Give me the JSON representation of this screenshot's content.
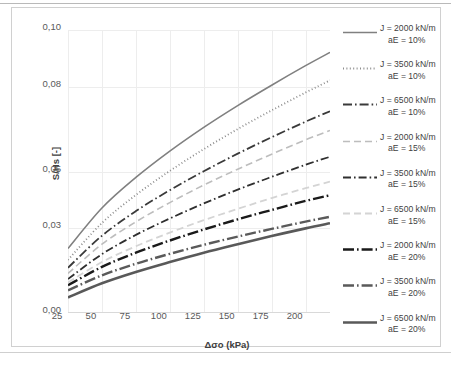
{
  "chart_data": {
    "type": "line",
    "title": "",
    "xlabel": "Δσo (kPa)",
    "ylabel": "S/Hs [-]",
    "xlim": [
      25,
      218
    ],
    "ylim": [
      0.0,
      0.1
    ],
    "xticks": [
      "25",
      "50",
      "75",
      "100",
      "125",
      "150",
      "175",
      "200"
    ],
    "xtick_values": [
      25,
      50,
      75,
      100,
      125,
      150,
      175,
      200
    ],
    "yticks": [
      "0,00",
      "0,03",
      "0,05",
      "0,08",
      "0,10"
    ],
    "ytick_values": [
      0.0,
      0.03,
      0.05,
      0.08,
      0.1
    ],
    "grid": true,
    "legend_position": "right",
    "x": [
      25,
      50,
      75,
      100,
      125,
      150,
      175,
      200,
      218
    ],
    "series": [
      {
        "name": "J = 2000 kN/m aE = 10%",
        "label_line1": "J = 2000 kN/m",
        "label_line2": "aE = 10%",
        "J": 2000,
        "aE": "10%",
        "style": "solid",
        "color": "#808080",
        "width": 1.6,
        "values": [
          0.0228,
          0.0371,
          0.0479,
          0.0572,
          0.0656,
          0.0733,
          0.0805,
          0.0874,
          0.0921
        ]
      },
      {
        "name": "J = 3500 kN/m aE = 10%",
        "label_line1": "J = 3500 kN/m",
        "label_line2": "aE = 10%",
        "J": 3500,
        "aE": "10%",
        "style": "dotted",
        "color": "#8c8c8c",
        "width": 1.8,
        "values": [
          0.0188,
          0.0318,
          0.0417,
          0.0502,
          0.0579,
          0.065,
          0.0716,
          0.0779,
          0.0822
        ]
      },
      {
        "name": "J = 6500 kN/m aE = 10%",
        "label_line1": "J = 6500 kN/m",
        "label_line2": "aE = 10%",
        "J": 6500,
        "aE": "10%",
        "style": "dashdot-dark",
        "color": "#3a3a3a",
        "width": 1.8,
        "values": [
          0.016,
          0.0273,
          0.036,
          0.0434,
          0.0501,
          0.0563,
          0.0621,
          0.0676,
          0.0713
        ]
      },
      {
        "name": "J = 2000 kN/m aE = 15%",
        "label_line1": "J = 2000 kN/m",
        "label_line2": "aE = 15%",
        "J": 2000,
        "aE": "15%",
        "style": "dashed-light",
        "color": "#bdbdbd",
        "width": 1.6,
        "values": [
          0.014,
          0.0243,
          0.0322,
          0.039,
          0.0452,
          0.0508,
          0.0561,
          0.0612,
          0.0645
        ]
      },
      {
        "name": "J = 3500 kN/m aE = 15%",
        "label_line1": "J = 3500 kN/m",
        "label_line2": "aE = 15%",
        "J": 3500,
        "aE": "15%",
        "style": "dashdot-mid",
        "color": "#2f2f2f",
        "width": 1.8,
        "values": [
          0.012,
          0.0208,
          0.0276,
          0.0334,
          0.0387,
          0.0436,
          0.0481,
          0.0524,
          0.0552
        ]
      },
      {
        "name": "J = 6500 kN/m aE = 15%",
        "label_line1": "J = 6500 kN/m",
        "label_line2": "aE = 15%",
        "J": 6500,
        "aE": "15%",
        "style": "dashed-verylight",
        "color": "#d4d4d4",
        "width": 1.8,
        "values": [
          0.0108,
          0.018,
          0.0236,
          0.0284,
          0.0328,
          0.0368,
          0.0406,
          0.0441,
          0.0464
        ]
      },
      {
        "name": "J = 2000 kN/m aE = 20%",
        "label_line1": "J = 2000 kN/m",
        "label_line2": "aE = 20%",
        "J": 2000,
        "aE": "20%",
        "style": "longdash-dot-bold",
        "color": "#1a1a1a",
        "width": 2.4,
        "values": [
          0.0098,
          0.0163,
          0.0213,
          0.0256,
          0.0295,
          0.0331,
          0.0364,
          0.0396,
          0.0416
        ]
      },
      {
        "name": "J = 3500 kN/m aE = 20%",
        "label_line1": "J = 3500 kN/m",
        "label_line2": "aE = 20%",
        "J": 3500,
        "aE": "20%",
        "style": "longdash-dot-grey",
        "color": "#5a5a5a",
        "width": 2.4,
        "values": [
          0.008,
          0.0133,
          0.0174,
          0.0209,
          0.0241,
          0.027,
          0.0297,
          0.0323,
          0.034
        ]
      },
      {
        "name": "J = 6500 kN/m aE = 20%",
        "label_line1": "J = 6500 kN/m",
        "label_line2": "aE = 20%",
        "J": 6500,
        "aE": "20%",
        "style": "solid-bold",
        "color": "#595959",
        "width": 2.6,
        "values": [
          0.0055,
          0.0105,
          0.0145,
          0.018,
          0.0213,
          0.0243,
          0.0272,
          0.0299,
          0.0317
        ]
      }
    ]
  },
  "axes": {
    "x_title": "Δσo (kPa)",
    "y_title": "S/Hs [-]"
  }
}
